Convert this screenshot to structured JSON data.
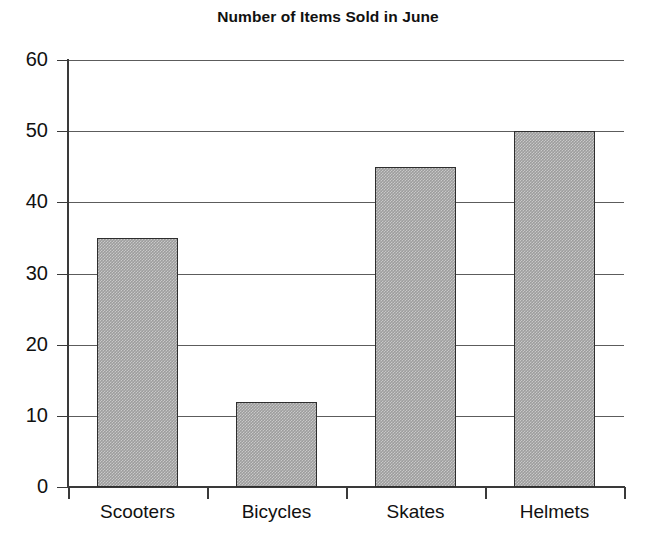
{
  "chart_data": {
    "type": "bar",
    "title": "Number of Items Sold in June",
    "xlabel": "",
    "ylabel": "",
    "categories": [
      "Scooters",
      "Bicycles",
      "Skates",
      "Helmets"
    ],
    "values": [
      35,
      12,
      45,
      50
    ],
    "ylim": [
      0,
      60
    ],
    "y_ticks": [
      0,
      10,
      20,
      30,
      40,
      50,
      60
    ],
    "y_tick_labels": [
      "0",
      "10",
      "20",
      "30",
      "40",
      "50",
      "60"
    ],
    "grid": true,
    "grid_axis": "y",
    "legend": false,
    "legend_position": "none",
    "bar_fill_color": "#9d9d9d",
    "bar_edge_color": "#2e2e2e",
    "gridline_color": "#5c5c5c",
    "axis_color": "#3a3a3a",
    "text_color": "#111111",
    "background_color": "#ffffff"
  }
}
